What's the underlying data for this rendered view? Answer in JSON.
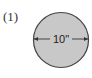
{
  "figure": {
    "label": "(1)",
    "shape": "circle",
    "dimension_label": "10\"",
    "fill_color": "#c8c8c8",
    "stroke_color": "#444444"
  }
}
